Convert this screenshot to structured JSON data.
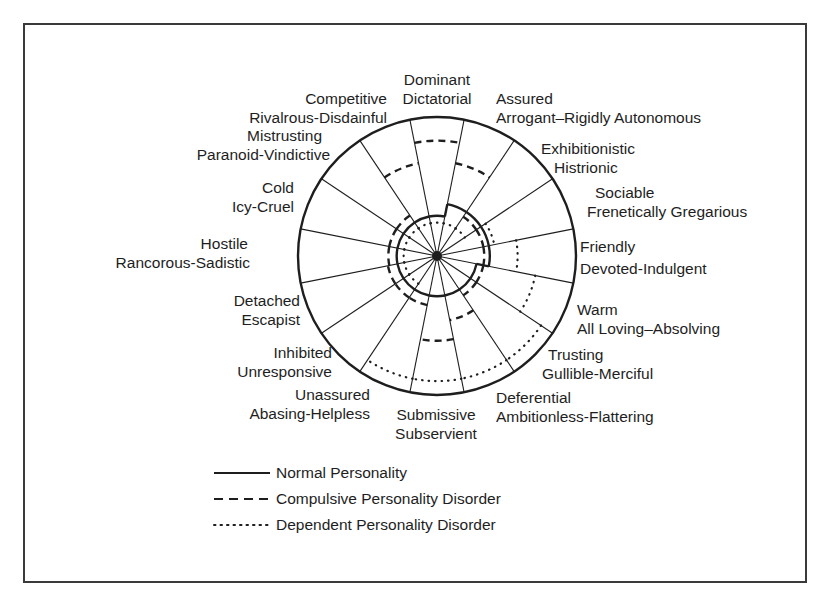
{
  "sectors": [
    {
      "id": "dominant",
      "normal": "Dominant",
      "disorder": "Dictatorial"
    },
    {
      "id": "assured",
      "normal": "Assured",
      "disorder": "Arrogant–Rigidly Autonomous"
    },
    {
      "id": "exhibitionistic",
      "normal": "Exhibitionistic",
      "disorder": "Histrionic"
    },
    {
      "id": "sociable",
      "normal": "Sociable",
      "disorder": "Frenetically Gregarious"
    },
    {
      "id": "friendly",
      "normal": "Friendly",
      "disorder": "Devoted-Indulgent"
    },
    {
      "id": "warm",
      "normal": "Warm",
      "disorder": "All Loving–Absolving"
    },
    {
      "id": "trusting",
      "normal": "Trusting",
      "disorder": "Gullible-Merciful"
    },
    {
      "id": "deferential",
      "normal": "Deferential",
      "disorder": "Ambitionless-Flattering"
    },
    {
      "id": "submissive",
      "normal": "Submissive",
      "disorder": "Subservient"
    },
    {
      "id": "unassured",
      "normal": "Unassured",
      "disorder": "Abasing-Helpless"
    },
    {
      "id": "inhibited",
      "normal": "Inhibited",
      "disorder": "Unresponsive"
    },
    {
      "id": "detached",
      "normal": "Detached",
      "disorder": "Escapist"
    },
    {
      "id": "hostile",
      "normal": "Hostile",
      "disorder": "Rancorous-Sadistic"
    },
    {
      "id": "cold",
      "normal": "Cold",
      "disorder": "Icy-Cruel"
    },
    {
      "id": "mistrusting",
      "normal": "Mistrusting",
      "disorder": "Paranoid-Vindictive"
    },
    {
      "id": "competitive",
      "normal": "Competitive",
      "disorder": "Rivalrous-Disdainful"
    }
  ],
  "profiles": [
    {
      "name": "Normal Personality",
      "style": "solid",
      "radii": [
        0.29,
        0.38,
        0.38,
        0.38,
        0.38,
        0.29,
        0.29,
        0.29,
        0.29,
        0.29,
        0.29,
        0.29,
        0.29,
        0.29,
        0.29,
        0.29
      ]
    },
    {
      "name": "Compulsive Personality Disorder",
      "style": "dashed",
      "radii": [
        0.83,
        0.68,
        0.34,
        0.34,
        0.34,
        0.34,
        0.34,
        0.47,
        0.61,
        0.36,
        0.36,
        0.36,
        0.35,
        0.35,
        0.35,
        0.68
      ]
    },
    {
      "name": "Dependent Personality Disorder",
      "style": "dotted",
      "radii": [
        0.24,
        0.24,
        0.24,
        0.42,
        0.58,
        0.72,
        0.9,
        0.9,
        0.9,
        0.9,
        0.24,
        0.24,
        0.24,
        0.24,
        0.24,
        0.24
      ]
    }
  ],
  "legend": {
    "normal": "Normal Personality",
    "compulsive": "Compulsive Personality Disorder",
    "dependent": "Dependent Personality Disorder"
  },
  "colors": {
    "ink": "#1e1e1e",
    "frame": "#3a3a3a",
    "background": "#ffffff"
  }
}
